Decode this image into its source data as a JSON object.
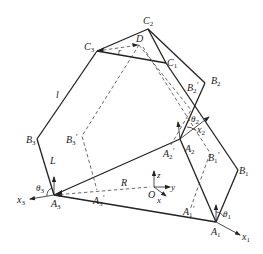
{
  "diagram": {
    "type": "parallel mechanism geometry (delta robot schematic)",
    "colors": {
      "line": "#222222",
      "background": "#ffffff"
    },
    "points": {
      "C1": {
        "label": "C",
        "sub": "1",
        "prime": ""
      },
      "C2": {
        "label": "C",
        "sub": "2",
        "prime": ""
      },
      "C3": {
        "label": "C",
        "sub": "3",
        "prime": ""
      },
      "D": {
        "label": "D",
        "sub": "",
        "prime": ""
      },
      "B1": {
        "label": "B",
        "sub": "1",
        "prime": ""
      },
      "B2": {
        "label": "B",
        "sub": "2",
        "prime": ""
      },
      "B3": {
        "label": "B",
        "sub": "3",
        "prime": ""
      },
      "B1p": {
        "label": "B",
        "sub": "1",
        "prime": "′"
      },
      "B2p": {
        "label": "B",
        "sub": "2",
        "prime": "′"
      },
      "B3p": {
        "label": "B",
        "sub": "3",
        "prime": "′"
      },
      "A1": {
        "label": "A",
        "sub": "1",
        "prime": ""
      },
      "A2": {
        "label": "A",
        "sub": "2",
        "prime": ""
      },
      "A3": {
        "label": "A",
        "sub": "3",
        "prime": ""
      },
      "A1p": {
        "label": "A",
        "sub": "1",
        "prime": "′"
      },
      "A2p": {
        "label": "A",
        "sub": "2",
        "prime": "′"
      },
      "A3p": {
        "label": "A",
        "sub": "3",
        "prime": "′"
      },
      "O": {
        "label": "O",
        "sub": "",
        "prime": ""
      }
    },
    "dimensions": {
      "l": "l",
      "L": "L",
      "R": "R",
      "r": "r"
    },
    "angles": {
      "theta1": {
        "label": "θ",
        "sub": "1"
      },
      "theta2": {
        "label": "θ",
        "sub": "2"
      },
      "theta3": {
        "label": "θ",
        "sub": "3"
      }
    },
    "axes": {
      "x1": {
        "label": "x",
        "sub": "1"
      },
      "x2": {
        "label": "x",
        "sub": "2"
      },
      "x3": {
        "label": "x",
        "sub": "3"
      },
      "x": "x",
      "y": "y",
      "z": "z"
    }
  }
}
